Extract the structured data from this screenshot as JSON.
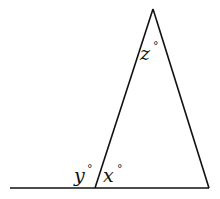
{
  "diagram": {
    "type": "geometry-triangle-exterior-angle",
    "labels": {
      "z": "z",
      "y": "y",
      "x": "x",
      "degree": "°"
    },
    "stroke_color": "#111111"
  }
}
